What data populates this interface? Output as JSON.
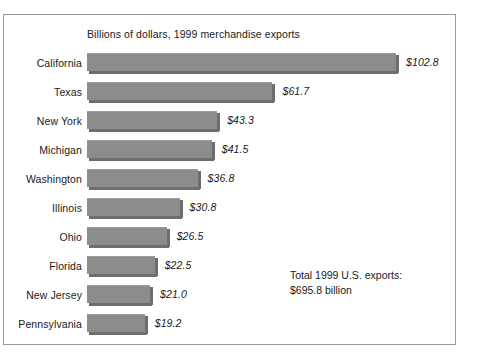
{
  "figure": {
    "title": "Billions of dollars, 1999 merchandise exports",
    "annotation_line1": "Total 1999 U.S. exports:",
    "annotation_line2": "$695.8 billion",
    "border_color": "#9a9a9a",
    "bar_color": "#8c8c8c",
    "bar_shadow_color": "#6e6e6e",
    "background_color": "#ffffff",
    "text_color": "#1a1a1a"
  },
  "chart_data": {
    "type": "bar",
    "orientation": "horizontal",
    "title": "Billions of dollars, 1999 merchandise exports",
    "xlabel": "",
    "ylabel": "",
    "xlim": [
      0,
      102.8
    ],
    "grid": false,
    "legend": false,
    "units": "billions of dollars",
    "year": 1999,
    "categories": [
      "California",
      "Texas",
      "New York",
      "Michigan",
      "Washington",
      "Illinois",
      "Ohio",
      "Florida",
      "New Jersey",
      "Pennsylvania"
    ],
    "values": [
      102.8,
      61.7,
      43.3,
      41.5,
      36.8,
      30.8,
      26.5,
      22.5,
      21.0,
      19.2
    ],
    "value_labels": [
      "$102.8",
      "$61.7",
      "$43.3",
      "$41.5",
      "$36.8",
      "$30.8",
      "$26.5",
      "$22.5",
      "$21.0",
      "$19.2"
    ],
    "annotations": [
      "Total 1999 U.S. exports:",
      "$695.8 billion"
    ]
  }
}
